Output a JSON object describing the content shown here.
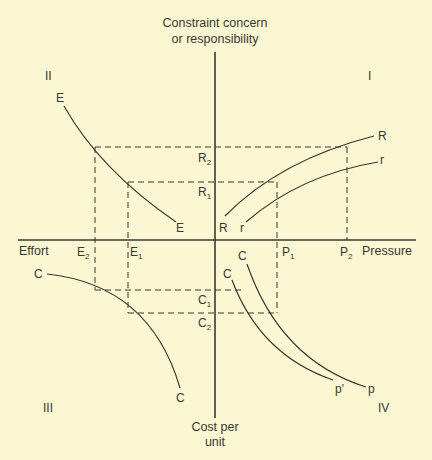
{
  "diagram": {
    "colors": {
      "background": "#fbf7d2",
      "ink": "#3a3833"
    },
    "axes": {
      "y_top_label_line1": "Constraint concern",
      "y_top_label_line2": "or responsibility",
      "y_bottom_label_line1": "Cost per",
      "y_bottom_label_line2": "unit",
      "x_left_label": "Effort",
      "x_right_label": "Pressure"
    },
    "quadrants": {
      "q1": "I",
      "q2": "II",
      "q3": "III",
      "q4": "IV"
    },
    "points": {
      "E2": {
        "main": "E",
        "sub": "2"
      },
      "E1": {
        "main": "E",
        "sub": "1"
      },
      "P1": {
        "main": "P",
        "sub": "1"
      },
      "P2": {
        "main": "P",
        "sub": "2"
      },
      "R1": {
        "main": "R",
        "sub": "1"
      },
      "R2": {
        "main": "R",
        "sub": "2"
      },
      "C1": {
        "main": "C",
        "sub": "1"
      },
      "C2": {
        "main": "C",
        "sub": "2"
      }
    },
    "curves": {
      "E": {
        "start_label": "E",
        "end_label": "E"
      },
      "R": {
        "start_label": "R",
        "end_label": "R"
      },
      "r": {
        "start_label": "r",
        "end_label": "r"
      },
      "C_III": {
        "start_label": "C",
        "end_label": "C"
      },
      "C_p": {
        "start_label": "C",
        "end_label": "p"
      },
      "C_p_prime": {
        "start_label": "C",
        "end_label": "p'"
      }
    }
  }
}
